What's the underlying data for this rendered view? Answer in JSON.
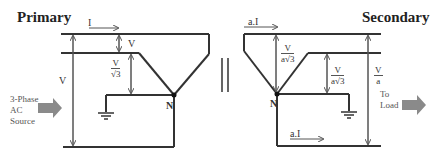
{
  "primary": {
    "title": "Primary",
    "current_label": "I",
    "line_voltage_label": "V",
    "delta_voltage_label": "V",
    "phase_voltage": {
      "num": "V",
      "den": "√3"
    },
    "neutral_label": "N",
    "source_label": [
      "3-Phase",
      "AC",
      "Source"
    ]
  },
  "secondary": {
    "title": "Secondary",
    "current_top_label": "a.I",
    "current_bottom_label": "a.I",
    "phase_voltage_1": {
      "num": "V",
      "den": "a√3"
    },
    "phase_voltage_2": {
      "num": "V",
      "den": "a√3"
    },
    "line_voltage": {
      "num": "V",
      "den": "a"
    },
    "neutral_label": "N",
    "load_label": [
      "To",
      "Load"
    ]
  },
  "colors": {
    "wire": "#333333",
    "arrow_fill": "#8a8a8a",
    "dim_arrow": "#555555"
  }
}
